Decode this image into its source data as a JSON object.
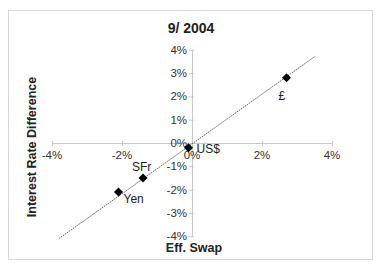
{
  "chart_data": {
    "type": "scatter",
    "title": "9/ 2004",
    "xlabel": "Eff. Swap",
    "ylabel": "Interest Rate Difference",
    "xlim": [
      -0.04,
      0.04
    ],
    "ylim": [
      -0.04,
      0.04
    ],
    "x_ticks": [
      "-4%",
      "-2%",
      "0%",
      "2%",
      "4%"
    ],
    "x_tick_values": [
      -0.04,
      -0.02,
      0,
      0.02,
      0.04
    ],
    "y_ticks": [
      "4%",
      "3%",
      "2%",
      "1%",
      "0%",
      "-1%",
      "-2%",
      "-3%",
      "-4%"
    ],
    "y_tick_values": [
      0.04,
      0.03,
      0.02,
      0.01,
      0,
      -0.01,
      -0.02,
      -0.03,
      -0.04
    ],
    "grid": false,
    "legend": null,
    "series": [
      {
        "name": "Currencies",
        "marker": "diamond",
        "points": [
          {
            "label": "£",
            "x": 0.027,
            "y": 0.028
          },
          {
            "label": "US$",
            "x": -0.001,
            "y": -0.002
          },
          {
            "label": "SFr",
            "x": -0.014,
            "y": -0.015
          },
          {
            "label": "Yen",
            "x": -0.021,
            "y": -0.021
          }
        ]
      }
    ],
    "trendline": {
      "type": "linear",
      "from": {
        "x": -0.038,
        "y": -0.041
      },
      "to": {
        "x": 0.035,
        "y": 0.037
      }
    }
  },
  "colors": {
    "marker": "#000000",
    "trendline": "#555555",
    "axis": "#c8c8c8",
    "frame": "#d9d9d9"
  }
}
